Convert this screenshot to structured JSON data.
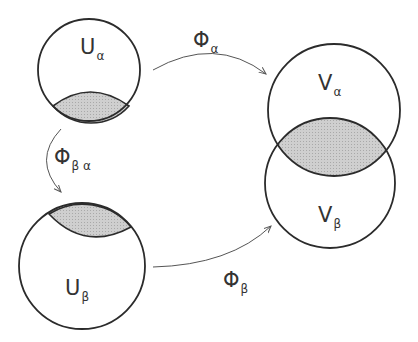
{
  "diagram": {
    "colors": {
      "stroke": "#2b2b2b",
      "overlap_fill": "#c8c8c8",
      "arrow": "#555555",
      "background": "#ffffff"
    },
    "sets": [
      {
        "id": "U_alpha",
        "main": "U",
        "sub": "α"
      },
      {
        "id": "U_beta",
        "main": "U",
        "sub": "β"
      },
      {
        "id": "V_alpha",
        "main": "V",
        "sub": "α"
      },
      {
        "id": "V_beta",
        "main": "V",
        "sub": "β"
      }
    ],
    "maps": [
      {
        "id": "phi_alpha",
        "main": "Φ",
        "sub": "α",
        "from": "U_alpha",
        "to": "V_alpha"
      },
      {
        "id": "phi_beta",
        "main": "Φ",
        "sub": "β",
        "from": "U_beta",
        "to": "V_beta"
      },
      {
        "id": "phi_beta_alpha",
        "main": "Φ",
        "sub": "β α",
        "from": "U_alpha",
        "to": "U_beta"
      }
    ]
  }
}
